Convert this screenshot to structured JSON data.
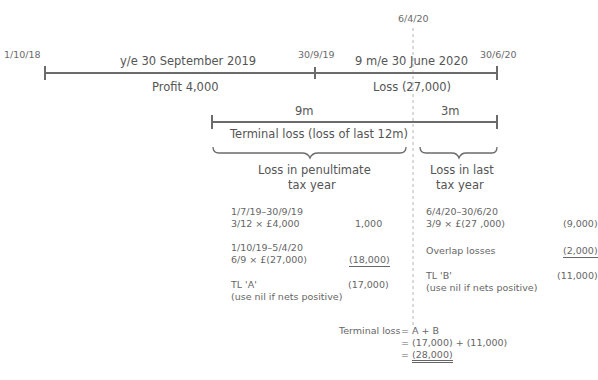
{
  "timeline": {
    "dates": {
      "start": "1/10/18",
      "mid": "30/9/19",
      "end": "30/6/20",
      "cessation_ref": "6/4/20"
    },
    "period1": {
      "label": "y/e 30 September 2019",
      "result": "Profit 4,000"
    },
    "period2": {
      "label": "9 m/e 30 June 2020",
      "result": "Loss (27,000)"
    }
  },
  "terminal_bar": {
    "left_span": "9m",
    "right_span": "3m",
    "label": "Terminal loss (loss of last 12m)"
  },
  "penultimate": {
    "heading_line1": "Loss in penultimate",
    "heading_line2": "tax year",
    "rows": [
      {
        "desc1": "1/7/19–30/9/19",
        "desc2": "3/12 × £4,000",
        "amount": "1,000"
      },
      {
        "desc1": "1/10/19–5/4/20",
        "desc2": "6/9 × £(27,000)",
        "amount": "(18,000)"
      }
    ],
    "total_label": "TL 'A'",
    "total_amount": "(17,000)",
    "note": "(use nil if nets positive)"
  },
  "last": {
    "heading_line1": "Loss in last",
    "heading_line2": "tax year",
    "rows": [
      {
        "desc1": "6/4/20–30/6/20",
        "desc2": "3/9 × £(27 ,000)",
        "amount": "(9,000)"
      },
      {
        "desc1": "Overlap losses",
        "amount": "(2,000)"
      }
    ],
    "total_label": "TL 'B'",
    "total_amount": "(11,000)",
    "note": "(use nil if nets positive)"
  },
  "summary": {
    "label": "Terminal loss",
    "line1": "= A + B",
    "line2": "= (17,000) + (11,000)",
    "line3_prefix": "= ",
    "line3_value": "(28,000)"
  },
  "colors": {
    "line": "#6b6b6b",
    "dashed": "#b0b0b0",
    "text": "#555555"
  }
}
